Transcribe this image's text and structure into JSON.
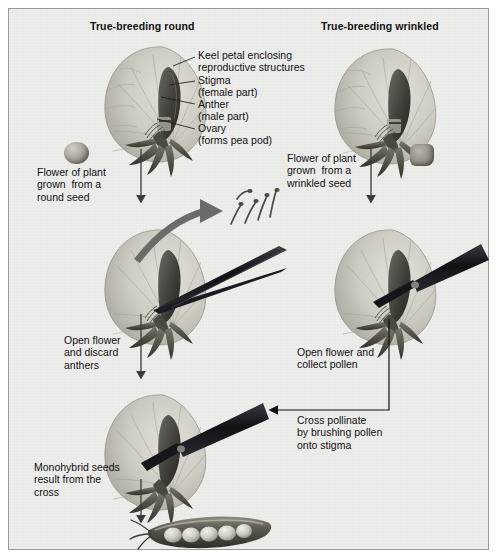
{
  "figure": {
    "type": "diagram",
    "headers": {
      "left": "True-breeding round",
      "right": "True-breeding wrinkled"
    },
    "anatomy_labels": [
      {
        "id": "keel",
        "text": "Keel petal enclosing\nreproductive structures"
      },
      {
        "id": "stigma",
        "text": "Stigma\n(female part)"
      },
      {
        "id": "anther",
        "text": "Anther\n(male part)"
      },
      {
        "id": "ovary",
        "text": "Ovary\n(forms pea pod)"
      }
    ],
    "step_captions": [
      {
        "id": "left-origin",
        "text": "Flower of plant\ngrown  from a\nround seed"
      },
      {
        "id": "right-origin",
        "text": "Flower of plant\ngrown  from a\nwrinkled seed"
      },
      {
        "id": "left-step2",
        "text": "Open flower\nand discard\nanthers"
      },
      {
        "id": "right-step2",
        "text": "Open flower and\ncollect pollen"
      },
      {
        "id": "cross",
        "text": "Cross pollinate\nby brushing pollen\nonto stigma"
      },
      {
        "id": "result",
        "text": "Monohybrid seeds\nresult from the\ncross"
      }
    ],
    "objects": [
      {
        "id": "round-seed",
        "name": "round-seed-icon"
      },
      {
        "id": "wrinkled-seed",
        "name": "wrinkled-seed-icon"
      },
      {
        "id": "discarded-anthers",
        "name": "discarded-anthers-icon",
        "count": 5
      },
      {
        "id": "pea-pod",
        "name": "pea-pod-icon",
        "peas": 6
      }
    ],
    "colors": {
      "panel_bg": "#e9e9e7",
      "panel_border": "#9a9a98",
      "text": "#111111",
      "arrow": "#3a3a3a",
      "discard_arrow": "#6b6b69",
      "tool_dark": "#15151a",
      "flower_petal": "#cdcac2",
      "flower_keel": "#4a4843"
    }
  }
}
